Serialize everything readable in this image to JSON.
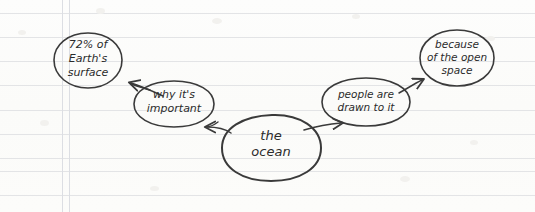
{
  "page": {
    "width": 535,
    "height": 212,
    "background_color": "#fdfdfb",
    "medium": "handwritten-notebook-paper",
    "rule_line_color": "#e3e4e6",
    "margin_line_color": "#dcdee3",
    "ink_color": "#333333"
  },
  "paper": {
    "horizontal_rule_y": [
      13,
      37,
      61,
      85,
      110,
      134,
      158,
      171,
      195
    ],
    "vertical_margin_x": [
      62,
      69
    ]
  },
  "diagram": {
    "type": "concept-map",
    "nodes": [
      {
        "id": "fact",
        "label": "72% of\nEarth's\nsurface",
        "shape": "ellipse",
        "cx": 88,
        "cy": 60,
        "rx": 34,
        "ry": 27
      },
      {
        "id": "why",
        "label": "why it's\nimportant",
        "shape": "ellipse",
        "cx": 174,
        "cy": 104,
        "rx": 40,
        "ry": 23
      },
      {
        "id": "center",
        "label": "the\nocean",
        "shape": "blob",
        "cx": 271,
        "cy": 148,
        "rx": 50,
        "ry": 33
      },
      {
        "id": "people",
        "label": "people are\ndrawn to it",
        "shape": "ellipse",
        "cx": 366,
        "cy": 102,
        "rx": 44,
        "ry": 24
      },
      {
        "id": "space",
        "label": "because\nof the open\nspace",
        "shape": "ellipse",
        "cx": 457,
        "cy": 58,
        "rx": 37,
        "ry": 28
      }
    ],
    "edges": [
      {
        "id": "center-to-why",
        "from": "center",
        "to": "why",
        "style": "curved-arrow"
      },
      {
        "id": "why-to-fact",
        "from": "why",
        "to": "fact",
        "style": "curved-arrow"
      },
      {
        "id": "center-to-people",
        "from": "center",
        "to": "people",
        "style": "curved-arrow"
      },
      {
        "id": "people-to-space",
        "from": "people",
        "to": "space",
        "style": "curved-arrow"
      }
    ]
  }
}
